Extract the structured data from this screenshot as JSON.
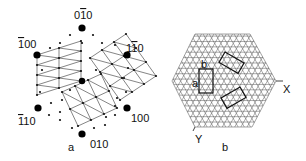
{
  "panel_a": {
    "caption": "a",
    "poles": [
      {
        "id": "p_0m10",
        "label_pre": "0",
        "label_bar": "1",
        "label_post": "0",
        "x": 82,
        "y": 28,
        "lx": 74,
        "ly": 19
      },
      {
        "id": "p_m100",
        "label_pre": "",
        "label_bar": "1",
        "label_post": "00",
        "x": 37,
        "y": 55,
        "lx": 18,
        "ly": 48
      },
      {
        "id": "p_1m10",
        "label_pre": "1",
        "label_bar": "1",
        "label_post": "0",
        "x": 127,
        "y": 55,
        "lx": 126,
        "ly": 52
      },
      {
        "id": "p_m110",
        "label_pre": "",
        "label_bar": "1",
        "label_post": "10",
        "x": 38,
        "y": 108,
        "lx": 18,
        "ly": 125
      },
      {
        "id": "p_100",
        "label_pre": "",
        "label_bar": "",
        "label_post": "100",
        "x": 127,
        "y": 108,
        "lx": 131,
        "ly": 122
      },
      {
        "id": "p_010",
        "label_pre": "",
        "label_bar": "",
        "label_post": "010",
        "x": 82,
        "y": 134,
        "lx": 90,
        "ly": 148
      },
      {
        "id": "center",
        "label_pre": "",
        "label_bar": "",
        "label_post": "",
        "x": 82,
        "y": 81,
        "lx": 0,
        "ly": 0
      }
    ],
    "caption_pos": {
      "x": 68,
      "y": 151
    }
  },
  "panel_b": {
    "caption": "b",
    "axis_x": "X",
    "axis_y": "Y",
    "label_a": "a",
    "label_b": "b",
    "hexagon": [
      [
        172,
        81
      ],
      [
        195,
        34
      ],
      [
        250,
        34
      ],
      [
        276,
        81
      ],
      [
        252,
        127
      ],
      [
        195,
        127
      ]
    ]
  }
}
